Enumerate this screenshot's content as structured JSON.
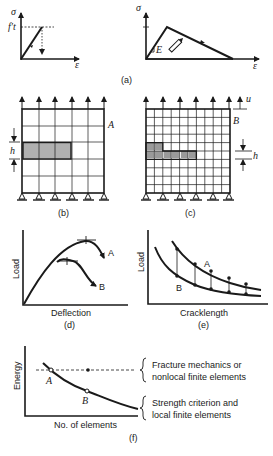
{
  "figure": {
    "panels": {
      "a": {
        "caption": "(a)",
        "left": {
          "y_label": "σ",
          "x_label": "ε",
          "strength_label": "f′t"
        },
        "right": {
          "y_label": "σ",
          "x_label": "ε",
          "modulus_label": "E"
        }
      },
      "b": {
        "caption": "(b)",
        "point_label": "A",
        "size_label": "h",
        "grid": [
          5,
          5
        ],
        "shaded_cells": 3
      },
      "c": {
        "caption": "(c)",
        "point_label": "B",
        "size_label": "h",
        "disp_label": "u",
        "grid": [
          10,
          10
        ],
        "shaded_cells": 7
      },
      "d": {
        "caption": "(d)",
        "x_label": "Deflection",
        "y_label": "Load",
        "curve_a": "A",
        "curve_b": "B"
      },
      "e": {
        "caption": "(e)",
        "x_label": "Cracklength",
        "y_label": "Load",
        "curve_a": "A",
        "curve_b": "B"
      },
      "f": {
        "caption": "(f)",
        "x_label": "No. of elements",
        "y_label": "Energy",
        "point_a": "A",
        "point_b": "B",
        "legend_upper_1": "Fracture mechanics or",
        "legend_upper_2": "nonlocal finite elements",
        "legend_lower_1": "Strength criterion and",
        "legend_lower_2": "local finite elements"
      }
    }
  }
}
